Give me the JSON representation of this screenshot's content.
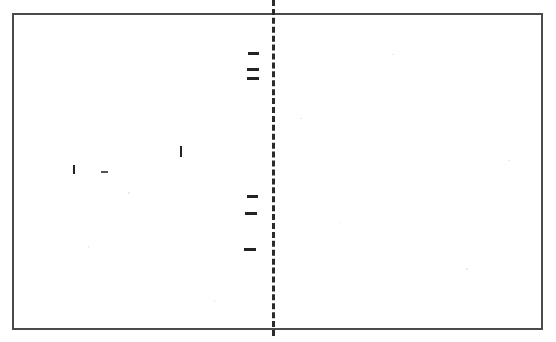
{
  "page": {
    "width": 556,
    "height": 342,
    "background_color": "#ffffff"
  },
  "frame": {
    "name": "outer-frame",
    "x": 12,
    "y": 13,
    "width": 531,
    "height": 317,
    "border_width": 2,
    "border_color": "#4a4a4a"
  },
  "divider": {
    "name": "vertical-dashed-divider",
    "x": 272,
    "y": 0,
    "height": 336,
    "thickness": 3,
    "color": "#2b2b2b",
    "dash_length": 7,
    "gap_length": 4,
    "style": "dashed"
  },
  "marks": {
    "upper_center_group": [
      {
        "label": "upper-dash-1",
        "x": 248,
        "y": 52,
        "width": 11,
        "height": 3,
        "orientation": "horizontal",
        "tone": "dark"
      },
      {
        "label": "upper-dash-2",
        "x": 247,
        "y": 68,
        "width": 12,
        "height": 3,
        "orientation": "horizontal",
        "tone": "dark"
      },
      {
        "label": "upper-dash-3",
        "x": 247,
        "y": 77,
        "width": 12,
        "height": 3,
        "orientation": "horizontal",
        "tone": "dark"
      }
    ],
    "lower_center_group": [
      {
        "label": "lower-dash-1",
        "x": 247,
        "y": 195,
        "width": 11,
        "height": 3,
        "orientation": "horizontal",
        "tone": "dark"
      },
      {
        "label": "lower-dash-2",
        "x": 245,
        "y": 212,
        "width": 12,
        "height": 3,
        "orientation": "horizontal",
        "tone": "dark"
      },
      {
        "label": "lower-dash-3",
        "x": 244,
        "y": 248,
        "width": 12,
        "height": 3,
        "orientation": "horizontal",
        "tone": "dark"
      }
    ],
    "left_group": [
      {
        "label": "left-tick-1",
        "x": 73,
        "y": 165,
        "width": 2,
        "height": 9,
        "orientation": "vertical",
        "tone": "dark"
      },
      {
        "label": "left-dash-1",
        "x": 101,
        "y": 171,
        "width": 7,
        "height": 2,
        "orientation": "horizontal",
        "tone": "faint"
      },
      {
        "label": "left-tick-2",
        "x": 180,
        "y": 146,
        "width": 2,
        "height": 11,
        "orientation": "vertical",
        "tone": "dark"
      }
    ]
  },
  "speckles": [
    {
      "x": 128,
      "y": 192,
      "width": 2,
      "height": 2
    },
    {
      "x": 300,
      "y": 118,
      "width": 2,
      "height": 1
    },
    {
      "x": 466,
      "y": 268,
      "width": 2,
      "height": 2
    },
    {
      "x": 214,
      "y": 300,
      "width": 1,
      "height": 2
    },
    {
      "x": 392,
      "y": 54,
      "width": 2,
      "height": 1
    },
    {
      "x": 88,
      "y": 246,
      "width": 1,
      "height": 2
    },
    {
      "x": 508,
      "y": 160,
      "width": 2,
      "height": 1
    },
    {
      "x": 340,
      "y": 222,
      "width": 1,
      "height": 1
    }
  ]
}
